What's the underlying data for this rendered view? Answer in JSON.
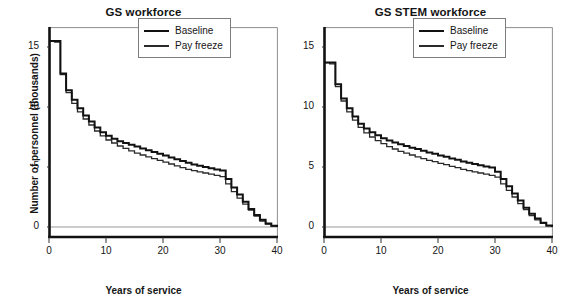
{
  "figure": {
    "background": "#ffffff",
    "axis_color": "#111111",
    "grid_color": "#9a9a9a"
  },
  "panels": [
    {
      "key": "gs_workforce",
      "title": "GS workforce",
      "xlabel": "Years of service",
      "ylabel": "Number of personnel (thousands)",
      "show_ylabel": true,
      "yticks": [
        "0",
        "5",
        "10",
        "15"
      ],
      "xticks": [
        "0",
        "10",
        "20",
        "30",
        "40"
      ],
      "legend": [
        {
          "label": "Baseline",
          "color": "#111111"
        },
        {
          "label": "Pay freeze",
          "color": "#2a2a2a"
        }
      ]
    },
    {
      "key": "gs_stem_workforce",
      "title": "GS STEM workforce",
      "xlabel": "Years of service",
      "ylabel": "",
      "show_ylabel": false,
      "yticks": [
        "0",
        "5",
        "10",
        "15"
      ],
      "xticks": [
        "0",
        "10",
        "20",
        "30",
        "40"
      ],
      "legend": [
        {
          "label": "Baseline",
          "color": "#111111"
        },
        {
          "label": "Pay freeze",
          "color": "#2a2a2a"
        }
      ]
    }
  ],
  "chart_data": [
    {
      "type": "line",
      "style": "step",
      "title": "GS workforce",
      "xlabel": "Years of service",
      "ylabel": "Number of personnel (thousands)",
      "xlim": [
        0,
        40
      ],
      "ylim": [
        0,
        16.5
      ],
      "xticks": [
        0,
        10,
        20,
        30,
        40
      ],
      "yticks": [
        0,
        5,
        10,
        15
      ],
      "grid": false,
      "zero_gridline": true,
      "legend_position": "upper-right",
      "x": [
        0,
        1,
        2,
        3,
        4,
        5,
        6,
        7,
        8,
        9,
        10,
        11,
        12,
        13,
        14,
        15,
        16,
        17,
        18,
        19,
        20,
        21,
        22,
        23,
        24,
        25,
        26,
        27,
        28,
        29,
        30,
        31,
        32,
        33,
        34,
        35,
        36,
        37,
        38,
        39,
        40
      ],
      "series": [
        {
          "name": "Baseline",
          "color": "#111111",
          "values": [
            15.5,
            15.5,
            12.8,
            11.4,
            10.6,
            9.9,
            9.3,
            8.8,
            8.3,
            7.9,
            7.6,
            7.35,
            7.15,
            7.0,
            6.85,
            6.7,
            6.55,
            6.4,
            6.25,
            6.1,
            5.95,
            5.8,
            5.65,
            5.5,
            5.35,
            5.2,
            5.1,
            5.0,
            4.9,
            4.8,
            4.7,
            4.0,
            3.3,
            2.7,
            2.1,
            1.5,
            1.0,
            0.6,
            0.3,
            0.1,
            0.0
          ]
        },
        {
          "name": "Pay freeze",
          "color": "#2a2a2a",
          "values": [
            15.5,
            15.4,
            12.7,
            11.2,
            10.3,
            9.6,
            9.0,
            8.5,
            8.0,
            7.6,
            7.25,
            7.0,
            6.75,
            6.55,
            6.35,
            6.15,
            6.0,
            5.85,
            5.7,
            5.55,
            5.4,
            5.25,
            5.1,
            4.95,
            4.8,
            4.7,
            4.6,
            4.5,
            4.4,
            4.3,
            4.2,
            3.6,
            2.95,
            2.4,
            1.9,
            1.4,
            0.9,
            0.5,
            0.25,
            0.08,
            0.0
          ]
        }
      ]
    },
    {
      "type": "line",
      "style": "step",
      "title": "GS STEM workforce",
      "xlabel": "Years of service",
      "ylabel": "Number of personnel (thousands)",
      "xlim": [
        0,
        40
      ],
      "ylim": [
        0,
        16.5
      ],
      "xticks": [
        0,
        10,
        20,
        30,
        40
      ],
      "yticks": [
        0,
        5,
        10,
        15
      ],
      "grid": false,
      "zero_gridline": true,
      "legend_position": "upper-right",
      "x": [
        0,
        1,
        2,
        3,
        4,
        5,
        6,
        7,
        8,
        9,
        10,
        11,
        12,
        13,
        14,
        15,
        16,
        17,
        18,
        19,
        20,
        21,
        22,
        23,
        24,
        25,
        26,
        27,
        28,
        29,
        30,
        31,
        32,
        33,
        34,
        35,
        36,
        37,
        38,
        39,
        40
      ],
      "series": [
        {
          "name": "Baseline",
          "color": "#111111",
          "values": [
            13.7,
            13.7,
            11.9,
            10.7,
            9.9,
            9.2,
            8.6,
            8.2,
            7.9,
            7.65,
            7.4,
            7.2,
            7.05,
            6.9,
            6.75,
            6.6,
            6.5,
            6.35,
            6.2,
            6.1,
            5.95,
            5.85,
            5.7,
            5.6,
            5.45,
            5.35,
            5.25,
            5.15,
            5.05,
            4.95,
            4.6,
            4.0,
            3.4,
            2.8,
            2.2,
            1.6,
            1.1,
            0.7,
            0.35,
            0.12,
            0.0
          ]
        },
        {
          "name": "Pay freeze",
          "color": "#2a2a2a",
          "values": [
            13.7,
            13.6,
            11.7,
            10.5,
            9.6,
            8.9,
            8.3,
            7.85,
            7.5,
            7.2,
            6.95,
            6.7,
            6.5,
            6.3,
            6.15,
            6.0,
            5.85,
            5.7,
            5.55,
            5.45,
            5.3,
            5.2,
            5.05,
            4.95,
            4.8,
            4.7,
            4.6,
            4.5,
            4.4,
            4.3,
            4.15,
            3.6,
            3.05,
            2.5,
            1.95,
            1.45,
            0.95,
            0.6,
            0.3,
            0.1,
            0.0
          ]
        }
      ]
    }
  ]
}
